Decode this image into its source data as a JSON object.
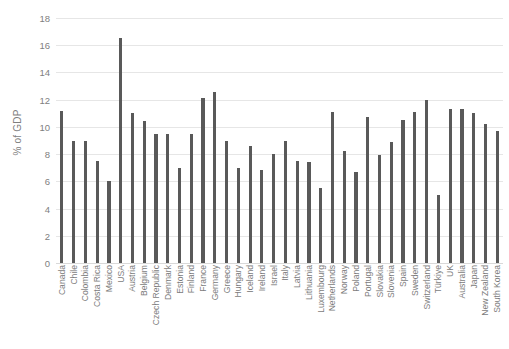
{
  "chart_data": {
    "type": "bar",
    "title": "",
    "subtitle": "",
    "xlabel": "",
    "ylabel": "% of GDP",
    "ylim": [
      0,
      18
    ],
    "ytick_step": 2,
    "yticks": [
      0,
      2,
      4,
      6,
      8,
      10,
      12,
      14,
      16,
      18
    ],
    "grid": true,
    "legend": false,
    "legend_position": "none",
    "bar_color": "#595959",
    "gridline_color": "#e6e6e6",
    "tick_label_color": "#808080",
    "categories": [
      "Canada",
      "Chile",
      "Colombia",
      "Costa Rica",
      "Mexico",
      "USA",
      "Austria",
      "Belgium",
      "Czech Republic",
      "Denmark",
      "Estonia",
      "Finland",
      "France",
      "Germany",
      "Greece",
      "Hungary",
      "Iceland",
      "Ireland",
      "Israel",
      "Italy",
      "Latvia",
      "Lithuania",
      "Luxembourg",
      "Netherlands",
      "Norway",
      "Poland",
      "Portugal",
      "Slovakia",
      "Slovenia",
      "Spain",
      "Sweden",
      "Switzerland",
      "Türkiye",
      "UK",
      "Australia",
      "Japan",
      "New Zealand",
      "South Korea"
    ],
    "values": [
      11.2,
      9.0,
      9.0,
      7.5,
      6.0,
      16.5,
      11.0,
      10.4,
      9.5,
      9.5,
      7.0,
      9.5,
      12.1,
      12.6,
      9.0,
      7.0,
      8.6,
      6.8,
      8.0,
      9.0,
      7.5,
      7.4,
      5.5,
      11.1,
      8.2,
      6.7,
      10.7,
      7.9,
      8.9,
      10.5,
      11.1,
      12.0,
      5.0,
      11.3,
      11.3,
      11.0,
      10.2,
      9.7
    ]
  }
}
